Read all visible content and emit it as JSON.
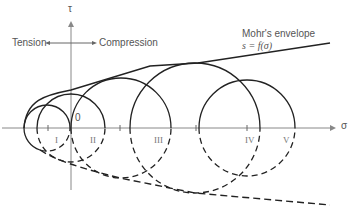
{
  "diagram": {
    "axis_tau": "τ",
    "axis_sigma": "σ",
    "origin": "0",
    "tension": "Tension",
    "compression": "Compression",
    "envelope_title": "Mohr's envelope",
    "envelope_eq": "s = f(σ)",
    "circle_labels": [
      "I",
      "II",
      "III",
      "IV",
      "V"
    ]
  }
}
